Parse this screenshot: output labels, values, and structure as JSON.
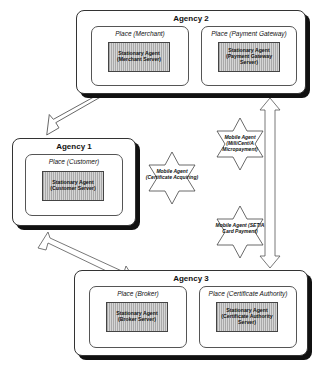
{
  "agencies": [
    {
      "title": "Agency 2",
      "places": [
        {
          "title": "Place (Merchant)",
          "agent": "Stationary Agent (Merchant Server)"
        },
        {
          "title": "Place (Payment Gateway)",
          "agent": "Stationary Agent (Payment Gateway Server)"
        }
      ]
    },
    {
      "title": "Agency 1",
      "places": [
        {
          "title": "Place (Customer)",
          "agent": "Stationary Agent (Customer Server)"
        }
      ]
    },
    {
      "title": "Agency 3",
      "places": [
        {
          "title": "Place (Broker)",
          "agent": "Stationary Agent (Broker Server)"
        },
        {
          "title": "Place (Certificate Authority)",
          "agent": "Stationary Agent (Certificate Authority Server)"
        }
      ]
    }
  ],
  "mobile_agents": [
    {
      "label": "Mobile Agent (MilliCent/A Micropayment)"
    },
    {
      "label": "Mobile Agent (Certificate Acquiring)"
    },
    {
      "label": "Mobile Agent (SET/A Card Payment)"
    }
  ],
  "connections": [
    {
      "from": "Agency 1",
      "to": "Agency 2",
      "type": "bidirectional"
    },
    {
      "from": "Agency 1",
      "to": "Agency 3",
      "type": "bidirectional"
    },
    {
      "from": "Agency 2",
      "to": "Agency 3",
      "type": "bidirectional"
    }
  ]
}
